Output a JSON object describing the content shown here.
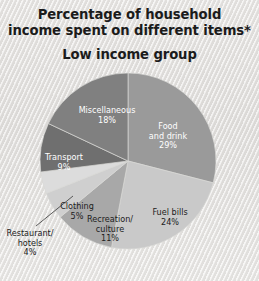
{
  "header": {
    "title_line_1": "Percentage of household",
    "title_line_2": "income spent on different items*",
    "subtitle": "Low income group"
  },
  "chart_data": {
    "type": "pie",
    "title": "Percentage of household income spent on different items*",
    "subtitle": "Low income group",
    "xlabel": "",
    "ylabel": "",
    "legend": "none",
    "grid": false,
    "units": "percent",
    "start_angle_deg": 0,
    "direction": "clockwise",
    "categories": [
      "Food and drink",
      "Fuel bills",
      "Recreation/culture",
      "Clothing",
      "Restaurant/hotels",
      "Transport",
      "Miscellaneous"
    ],
    "values": [
      29,
      24,
      11,
      5,
      4,
      9,
      18
    ],
    "colors": [
      "#9a9a9a",
      "#c9c9c9",
      "#a8a8a8",
      "#cfcfcf",
      "#dcdcdc",
      "#6f6f6f",
      "#808080"
    ],
    "slices": [
      {
        "name": "Food and drink",
        "value": 29,
        "label_line_1": "Food",
        "label_line_2": "and drink",
        "label_value": "29%",
        "color": "#9a9a9a",
        "text_color": "#ffffff",
        "label_x": 168,
        "label_y": 129,
        "inside": true,
        "leader": false
      },
      {
        "name": "Fuel bills",
        "value": 24,
        "label_line_1": "Fuel bills",
        "label_line_2": "",
        "label_value": "24%",
        "color": "#c9c9c9",
        "text_color": "#1c1c1c",
        "label_x": 170,
        "label_y": 215,
        "inside": true,
        "leader": false
      },
      {
        "name": "Recreation/culture",
        "value": 11,
        "label_line_1": "Recreation/",
        "label_line_2": "culture",
        "label_value": "11%",
        "color": "#a8a8a8",
        "text_color": "#1c1c1c",
        "label_x": 110,
        "label_y": 222,
        "inside": true,
        "leader": false
      },
      {
        "name": "Clothing",
        "value": 5,
        "label_line_1": "Clothing",
        "label_line_2": "",
        "label_value": "5%",
        "color": "#cfcfcf",
        "text_color": "#1c1c1c",
        "label_x": 77,
        "label_y": 209,
        "inside": true,
        "leader": false
      },
      {
        "name": "Restaurant/hotels",
        "value": 4,
        "label_line_1": "Restaurant/",
        "label_line_2": "hotels",
        "label_value": "4%",
        "color": "#dcdcdc",
        "text_color": "#1c1c1c",
        "label_x": 30,
        "label_y": 236,
        "inside": false,
        "leader": true
      },
      {
        "name": "Transport",
        "value": 9,
        "label_line_1": "Transport",
        "label_line_2": "",
        "label_value": "9%",
        "color": "#6f6f6f",
        "text_color": "#ffffff",
        "label_x": 64,
        "label_y": 160,
        "inside": true,
        "leader": false
      },
      {
        "name": "Miscellaneous",
        "value": 18,
        "label_line_1": "Miscellaneous",
        "label_line_2": "",
        "label_value": "18%",
        "color": "#808080",
        "text_color": "#ffffff",
        "label_x": 107,
        "label_y": 113,
        "inside": true,
        "leader": false
      }
    ]
  },
  "geometry": {
    "cx": 128,
    "cy": 161,
    "r": 88
  }
}
